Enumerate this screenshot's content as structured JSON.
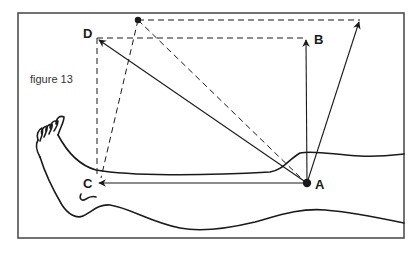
{
  "figure": {
    "caption": "figure 13",
    "colors": {
      "ink": "#1a1a1a",
      "frame": "#444444",
      "background": "#ffffff"
    },
    "points": {
      "A": {
        "label": "A",
        "x": 307,
        "y": 183,
        "marker": "dot"
      },
      "B": {
        "label": "B",
        "x": 306,
        "y": 38,
        "marker": "arrowhead"
      },
      "C": {
        "label": "C",
        "x": 97,
        "y": 183,
        "marker": "arrowhead"
      },
      "D": {
        "label": "D",
        "x": 97,
        "y": 38,
        "marker": "arrowhead"
      },
      "E": {
        "label": "",
        "x": 138,
        "y": 20,
        "marker": "dot"
      },
      "F": {
        "label": "",
        "x": 360,
        "y": 20,
        "marker": "arrowhead"
      }
    },
    "vectors": [
      {
        "from": "A",
        "to": "B",
        "style": "solid"
      },
      {
        "from": "A",
        "to": "C",
        "style": "solid"
      },
      {
        "from": "A",
        "to": "D",
        "style": "solid"
      },
      {
        "from": "A",
        "to": "F",
        "style": "solid"
      }
    ],
    "dashed_lines": [
      {
        "from": "D",
        "to": "B"
      },
      {
        "from": "D",
        "to": "C"
      },
      {
        "from": "E",
        "to": "F"
      },
      {
        "from": "E",
        "to": "C"
      },
      {
        "from": "E",
        "to": "A"
      }
    ],
    "illustration": "leg-and-foot-outline"
  }
}
